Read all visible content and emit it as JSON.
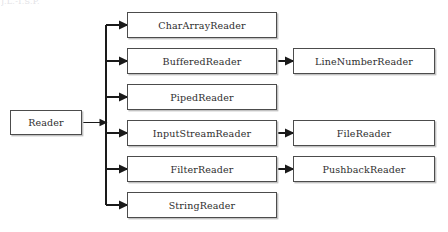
{
  "diagram": {
    "title_artifact": "J.L.-I.S.P.",
    "type": "class-hierarchy-tree",
    "root": {
      "id": "reader",
      "label": "Reader",
      "x": 10,
      "y": 110,
      "w": 72,
      "h": 25
    },
    "level1": [
      {
        "id": "chararrayreader",
        "label": "CharArrayReader",
        "x": 127,
        "y": 12,
        "w": 150,
        "h": 26
      },
      {
        "id": "bufferedreader",
        "label": "BufferedReader",
        "x": 127,
        "y": 48,
        "w": 150,
        "h": 26
      },
      {
        "id": "pipedreader",
        "label": "PipedReader",
        "x": 127,
        "y": 84,
        "w": 150,
        "h": 26
      },
      {
        "id": "inputstreamreader",
        "label": "InputStreamReader",
        "x": 127,
        "y": 120,
        "w": 150,
        "h": 26
      },
      {
        "id": "filterreader",
        "label": "FilterReader",
        "x": 127,
        "y": 156,
        "w": 150,
        "h": 26
      },
      {
        "id": "stringreader",
        "label": "StringReader",
        "x": 127,
        "y": 192,
        "w": 150,
        "h": 26
      }
    ],
    "level2": [
      {
        "id": "linenumberreader",
        "label": "LineNumberReader",
        "x": 293,
        "y": 48,
        "w": 142,
        "h": 26,
        "parent": "bufferedreader"
      },
      {
        "id": "filereader",
        "label": "FileReader",
        "x": 293,
        "y": 120,
        "w": 142,
        "h": 26,
        "parent": "inputstreamreader"
      },
      {
        "id": "pushbackreader",
        "label": "PushbackReader",
        "x": 293,
        "y": 156,
        "w": 142,
        "h": 26,
        "parent": "filterreader"
      }
    ],
    "colors": {
      "box_border": "#4c4c4c",
      "box_shadow": "#c2c2c2",
      "wire": "#1a1a1a",
      "text": "#2e2e2e",
      "background": "#ffffff"
    }
  }
}
